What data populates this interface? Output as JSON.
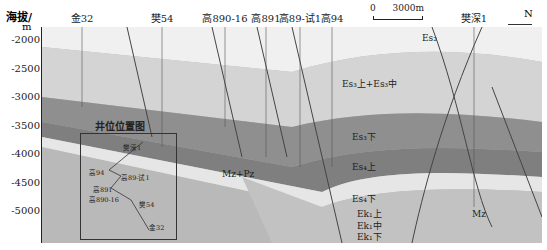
{
  "axis": {
    "title": "海拔/",
    "unit": "m",
    "ticks": [
      "-2000",
      "-2500",
      "-3000",
      "-3500",
      "-4000",
      "-4500",
      "-5000"
    ]
  },
  "wells": [
    {
      "name": "金32",
      "x": 82
    },
    {
      "name": "樊54",
      "x": 162
    },
    {
      "name": "高890-16",
      "x": 225
    },
    {
      "name": "高891",
      "x": 266
    },
    {
      "name": "高89-试1",
      "x": 300
    },
    {
      "name": "高94",
      "x": 332
    },
    {
      "name": "樊深1",
      "x": 474
    }
  ],
  "scale_bar": {
    "zero": "0",
    "length": "3000m"
  },
  "north": "N",
  "formations": {
    "es2": "Es₂",
    "es3_upper_mid": "Es₃上+Es₃中",
    "es3_lower": "Es₃下",
    "es4_upper": "Es₄上",
    "es4_lower": "Es₄下",
    "ek1_upper": "Ek₁上",
    "ek1_mid": "Ek₁中",
    "ek1_lower": "Ek₁下",
    "mz_pz": "Mz+Pz",
    "mz": "Mz"
  },
  "inset": {
    "title": "井位位置图",
    "labels": [
      {
        "name": "樊深1",
        "x": 42,
        "y": 8
      },
      {
        "name": "高94",
        "x": 8,
        "y": 33
      },
      {
        "name": "高89-试1",
        "x": 40,
        "y": 38
      },
      {
        "name": "高891",
        "x": 12,
        "y": 50
      },
      {
        "name": "高890-16",
        "x": 8,
        "y": 60
      },
      {
        "name": "樊54",
        "x": 58,
        "y": 65
      },
      {
        "name": "金32",
        "x": 68,
        "y": 88
      }
    ]
  },
  "colors": {
    "light": "#ebebeb",
    "mid": "#c8c8c8",
    "dark": "#8f8f8f",
    "darker": "#7c7c7c",
    "pale": "#dcdcdc",
    "base": "#b9b9b9"
  }
}
